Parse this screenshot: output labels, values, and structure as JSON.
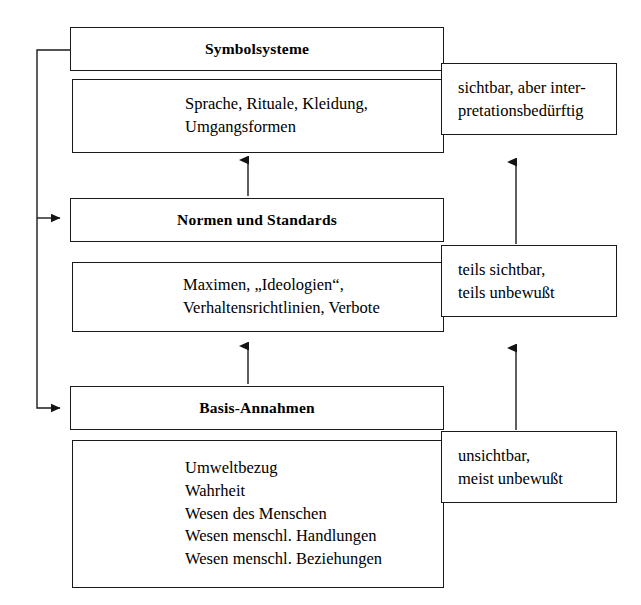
{
  "diagram": {
    "line_color": "#1a1a1a",
    "background": "#ffffff",
    "levels": [
      {
        "id": "symbolsysteme",
        "heading": "Symbolsysteme",
        "content": "Sprache, Rituale, Kleidung,\nUmgangsformen",
        "visibility": "sichtbar, aber inter-\npretationsbedürftig"
      },
      {
        "id": "normen-und-standards",
        "heading": "Normen und Standards",
        "content": "Maximen, „Ideologien“,\nVerhaltensrichtlinien, Verbote",
        "visibility": "teils sichtbar,\nteils unbewußt"
      },
      {
        "id": "basis-annahmen",
        "heading": "Basis-Annahmen",
        "content": "Umweltbezug\nWahrheit\nWesen des Menschen\nWesen menschl. Handlungen\nWesen menschl. Beziehungen",
        "visibility": "unsichtbar,\nmeist unbewußt"
      }
    ]
  }
}
